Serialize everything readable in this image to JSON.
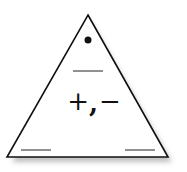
{
  "card": {
    "type": "fact-family-triangle",
    "shape": "triangle",
    "fill_color": "#ffffff",
    "stroke_color": "#111111",
    "shadow_color": "#bbbbbb",
    "top_marker": "dot",
    "operations": {
      "plus": "+",
      "comma": ",",
      "minus": "−"
    },
    "blanks": [
      {
        "position": "top",
        "value": ""
      },
      {
        "position": "bottom-left",
        "value": ""
      },
      {
        "position": "bottom-right",
        "value": ""
      }
    ]
  }
}
